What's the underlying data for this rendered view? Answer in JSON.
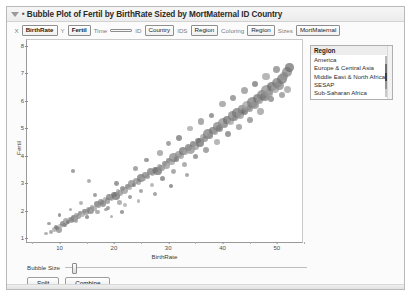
{
  "window": {
    "title": "Bubble Plot of Fertil by BirthRate Sized by MortMaternal ID Country",
    "disclosure_icon": "triangle-down-icon",
    "bullet": "▪"
  },
  "variable_bar": {
    "entries": [
      {
        "tag": "X",
        "value": "BirthRate"
      },
      {
        "tag": "Y",
        "value": "Fertil"
      },
      {
        "tag": "Time",
        "value": ""
      },
      {
        "tag": "ID",
        "value": "Country"
      },
      {
        "tag": "IDS",
        "value": "Region"
      },
      {
        "tag": "Coloring",
        "value": "Region"
      },
      {
        "tag": "Sizes",
        "value": "MortMaternal"
      }
    ]
  },
  "legend": {
    "title": "Region",
    "items": [
      {
        "label": "America",
        "color": "#b9b9b9"
      },
      {
        "label": "Europe & Central Asia",
        "color": "#6e6e6e"
      },
      {
        "label": "Middle East & North Africa",
        "color": "#3f3f3f"
      },
      {
        "label": "SESAP",
        "color": "#949494"
      },
      {
        "label": "Sub-Saharan Africa",
        "color": "#c9c9c9"
      }
    ]
  },
  "controls": {
    "bubble_size_label": "Bubble Size",
    "bubble_size_value": 3,
    "split_label": "Split",
    "combine_label": "Combine"
  },
  "chart_data": {
    "type": "scatter",
    "title": "Bubble Plot of Fertil by BirthRate Sized by MortMaternal ID Country",
    "xlabel": "BirthRate",
    "ylabel": "Fertil",
    "xlim": [
      4,
      55
    ],
    "ylim": [
      0.8,
      8.2
    ],
    "xticks": [
      10,
      20,
      30,
      40,
      50
    ],
    "yticks": [
      1,
      2,
      3,
      4,
      5,
      6,
      7,
      8
    ],
    "grid": false,
    "legend_position": "right",
    "size_variable": "MortMaternal",
    "color_variable": "Region",
    "id_variable": "Country",
    "points": [
      {
        "x": 8.5,
        "y": 1.25,
        "r": 2.0,
        "c": "#8e8e8e"
      },
      {
        "x": 9.0,
        "y": 1.32,
        "r": 2.4,
        "c": "#9b9b9b"
      },
      {
        "x": 9.4,
        "y": 1.4,
        "r": 2.0,
        "c": "#747474"
      },
      {
        "x": 9.8,
        "y": 1.3,
        "r": 3.0,
        "c": "#838383"
      },
      {
        "x": 10.2,
        "y": 1.45,
        "r": 2.2,
        "c": "#a2a2a2"
      },
      {
        "x": 10.5,
        "y": 1.55,
        "r": 2.6,
        "c": "#787878"
      },
      {
        "x": 10.8,
        "y": 1.5,
        "r": 2.0,
        "c": "#8c8c8c"
      },
      {
        "x": 11.2,
        "y": 1.62,
        "r": 3.2,
        "c": "#909090"
      },
      {
        "x": 11.6,
        "y": 1.58,
        "r": 2.0,
        "c": "#6e6e6e"
      },
      {
        "x": 11.9,
        "y": 1.7,
        "r": 2.4,
        "c": "#9a9a9a"
      },
      {
        "x": 12.2,
        "y": 1.66,
        "r": 2.8,
        "c": "#858585"
      },
      {
        "x": 12.5,
        "y": 1.78,
        "r": 2.0,
        "c": "#adadad"
      },
      {
        "x": 12.8,
        "y": 1.72,
        "r": 3.4,
        "c": "#7c7c7c"
      },
      {
        "x": 13.1,
        "y": 1.85,
        "r": 2.2,
        "c": "#949494"
      },
      {
        "x": 13.5,
        "y": 1.8,
        "r": 2.6,
        "c": "#8a8a8a"
      },
      {
        "x": 13.8,
        "y": 1.92,
        "r": 2.0,
        "c": "#707070"
      },
      {
        "x": 14.2,
        "y": 1.88,
        "r": 3.0,
        "c": "#9e9e9e"
      },
      {
        "x": 14.6,
        "y": 2.0,
        "r": 2.4,
        "c": "#7e7e7e"
      },
      {
        "x": 14.9,
        "y": 1.95,
        "r": 2.8,
        "c": "#8f8f8f"
      },
      {
        "x": 15.3,
        "y": 2.08,
        "r": 2.0,
        "c": "#a6a6a6"
      },
      {
        "x": 15.7,
        "y": 2.02,
        "r": 3.6,
        "c": "#767676"
      },
      {
        "x": 16.0,
        "y": 2.15,
        "r": 2.2,
        "c": "#8b8b8b"
      },
      {
        "x": 16.4,
        "y": 2.1,
        "r": 2.6,
        "c": "#999999"
      },
      {
        "x": 16.8,
        "y": 2.25,
        "r": 3.0,
        "c": "#6f6f6f"
      },
      {
        "x": 17.2,
        "y": 2.18,
        "r": 2.4,
        "c": "#929292"
      },
      {
        "x": 17.6,
        "y": 2.32,
        "r": 2.8,
        "c": "#828282"
      },
      {
        "x": 18.0,
        "y": 2.28,
        "r": 3.4,
        "c": "#7a7a7a"
      },
      {
        "x": 18.4,
        "y": 2.42,
        "r": 2.2,
        "c": "#a0a0a0"
      },
      {
        "x": 18.8,
        "y": 2.36,
        "r": 2.6,
        "c": "#888888"
      },
      {
        "x": 19.2,
        "y": 2.5,
        "r": 3.2,
        "c": "#757575"
      },
      {
        "x": 19.6,
        "y": 2.45,
        "r": 2.4,
        "c": "#969696"
      },
      {
        "x": 20.0,
        "y": 2.6,
        "r": 2.8,
        "c": "#808080"
      },
      {
        "x": 20.4,
        "y": 2.55,
        "r": 3.8,
        "c": "#6c6c6c"
      },
      {
        "x": 20.8,
        "y": 2.7,
        "r": 2.2,
        "c": "#a4a4a4"
      },
      {
        "x": 21.2,
        "y": 2.65,
        "r": 3.0,
        "c": "#8d8d8d"
      },
      {
        "x": 21.6,
        "y": 2.8,
        "r": 2.6,
        "c": "#7d7d7d"
      },
      {
        "x": 22.0,
        "y": 2.74,
        "r": 3.4,
        "c": "#909090"
      },
      {
        "x": 22.5,
        "y": 2.9,
        "r": 2.4,
        "c": "#727272"
      },
      {
        "x": 22.9,
        "y": 2.85,
        "r": 2.8,
        "c": "#9c9c9c"
      },
      {
        "x": 23.3,
        "y": 3.0,
        "r": 3.6,
        "c": "#848484"
      },
      {
        "x": 23.7,
        "y": 2.95,
        "r": 2.2,
        "c": "#787878"
      },
      {
        "x": 24.1,
        "y": 3.1,
        "r": 3.0,
        "c": "#8a8a8a"
      },
      {
        "x": 24.5,
        "y": 3.05,
        "r": 2.6,
        "c": "#989898"
      },
      {
        "x": 25.0,
        "y": 3.2,
        "r": 4.0,
        "c": "#6e6e6e"
      },
      {
        "x": 25.4,
        "y": 3.16,
        "r": 2.4,
        "c": "#a1a1a1"
      },
      {
        "x": 25.8,
        "y": 3.3,
        "r": 3.2,
        "c": "#7f7f7f"
      },
      {
        "x": 26.2,
        "y": 3.25,
        "r": 2.8,
        "c": "#8e8e8e"
      },
      {
        "x": 26.7,
        "y": 3.42,
        "r": 3.6,
        "c": "#767676"
      },
      {
        "x": 27.1,
        "y": 3.36,
        "r": 2.4,
        "c": "#959595"
      },
      {
        "x": 27.5,
        "y": 3.5,
        "r": 3.0,
        "c": "#838383"
      },
      {
        "x": 28.0,
        "y": 3.45,
        "r": 4.2,
        "c": "#6b6b6b"
      },
      {
        "x": 28.4,
        "y": 3.62,
        "r": 2.6,
        "c": "#9f9f9f"
      },
      {
        "x": 28.8,
        "y": 3.56,
        "r": 3.4,
        "c": "#888888"
      },
      {
        "x": 29.3,
        "y": 3.72,
        "r": 2.8,
        "c": "#7b7b7b"
      },
      {
        "x": 29.7,
        "y": 3.66,
        "r": 3.8,
        "c": "#919191"
      },
      {
        "x": 30.1,
        "y": 3.82,
        "r": 2.4,
        "c": "#737373"
      },
      {
        "x": 30.6,
        "y": 3.78,
        "r": 3.2,
        "c": "#9a9a9a"
      },
      {
        "x": 31.0,
        "y": 3.95,
        "r": 4.4,
        "c": "#818181"
      },
      {
        "x": 31.5,
        "y": 3.88,
        "r": 2.6,
        "c": "#777777"
      },
      {
        "x": 31.9,
        "y": 4.05,
        "r": 3.6,
        "c": "#8c8c8c"
      },
      {
        "x": 32.3,
        "y": 4.0,
        "r": 3.0,
        "c": "#979797"
      },
      {
        "x": 32.8,
        "y": 4.18,
        "r": 4.0,
        "c": "#6d6d6d"
      },
      {
        "x": 33.2,
        "y": 4.12,
        "r": 2.8,
        "c": "#a3a3a3"
      },
      {
        "x": 33.7,
        "y": 4.3,
        "r": 3.4,
        "c": "#7e7e7e"
      },
      {
        "x": 34.1,
        "y": 4.24,
        "r": 4.6,
        "c": "#8a8a8a"
      },
      {
        "x": 34.6,
        "y": 4.42,
        "r": 3.0,
        "c": "#757575"
      },
      {
        "x": 35.0,
        "y": 4.36,
        "r": 3.8,
        "c": "#939393"
      },
      {
        "x": 35.5,
        "y": 4.55,
        "r": 2.8,
        "c": "#828282"
      },
      {
        "x": 35.9,
        "y": 4.48,
        "r": 4.2,
        "c": "#6a6a6a"
      },
      {
        "x": 36.4,
        "y": 4.68,
        "r": 3.4,
        "c": "#9d9d9d"
      },
      {
        "x": 36.8,
        "y": 4.6,
        "r": 3.0,
        "c": "#868686"
      },
      {
        "x": 37.3,
        "y": 4.8,
        "r": 4.8,
        "c": "#797979"
      },
      {
        "x": 37.7,
        "y": 4.72,
        "r": 3.2,
        "c": "#8f8f8f"
      },
      {
        "x": 38.2,
        "y": 4.92,
        "r": 3.8,
        "c": "#717171"
      },
      {
        "x": 38.6,
        "y": 4.86,
        "r": 2.8,
        "c": "#999999"
      },
      {
        "x": 39.1,
        "y": 5.05,
        "r": 4.4,
        "c": "#808080"
      },
      {
        "x": 39.5,
        "y": 4.98,
        "r": 3.4,
        "c": "#767676"
      },
      {
        "x": 40.0,
        "y": 5.18,
        "r": 5.0,
        "c": "#8b8b8b"
      },
      {
        "x": 40.5,
        "y": 5.1,
        "r": 3.0,
        "c": "#969696"
      },
      {
        "x": 40.9,
        "y": 5.3,
        "r": 4.0,
        "c": "#6c6c6c"
      },
      {
        "x": 41.4,
        "y": 5.24,
        "r": 3.6,
        "c": "#a0a0a0"
      },
      {
        "x": 41.8,
        "y": 5.44,
        "r": 4.6,
        "c": "#7d7d7d"
      },
      {
        "x": 42.3,
        "y": 5.36,
        "r": 3.2,
        "c": "#898989"
      },
      {
        "x": 42.7,
        "y": 5.56,
        "r": 5.2,
        "c": "#747474"
      },
      {
        "x": 43.2,
        "y": 5.48,
        "r": 3.8,
        "c": "#929292"
      },
      {
        "x": 43.6,
        "y": 5.68,
        "r": 4.2,
        "c": "#818181"
      },
      {
        "x": 44.1,
        "y": 5.6,
        "r": 3.4,
        "c": "#696969"
      },
      {
        "x": 44.5,
        "y": 5.8,
        "r": 4.8,
        "c": "#9b9b9b"
      },
      {
        "x": 45.0,
        "y": 5.72,
        "r": 3.6,
        "c": "#858585"
      },
      {
        "x": 45.5,
        "y": 5.94,
        "r": 5.4,
        "c": "#787878"
      },
      {
        "x": 45.9,
        "y": 5.86,
        "r": 4.0,
        "c": "#8e8e8e"
      },
      {
        "x": 46.4,
        "y": 6.08,
        "r": 4.4,
        "c": "#707070"
      },
      {
        "x": 46.8,
        "y": 6.0,
        "r": 3.6,
        "c": "#989898"
      },
      {
        "x": 47.3,
        "y": 6.22,
        "r": 5.0,
        "c": "#7f7f7f"
      },
      {
        "x": 47.7,
        "y": 6.14,
        "r": 4.2,
        "c": "#737373"
      },
      {
        "x": 48.2,
        "y": 6.36,
        "r": 5.6,
        "c": "#8a8a8a"
      },
      {
        "x": 48.6,
        "y": 6.28,
        "r": 3.8,
        "c": "#949494"
      },
      {
        "x": 49.1,
        "y": 6.5,
        "r": 4.6,
        "c": "#6b6b6b"
      },
      {
        "x": 49.6,
        "y": 6.42,
        "r": 4.0,
        "c": "#9e9e9e"
      },
      {
        "x": 50.0,
        "y": 6.64,
        "r": 5.2,
        "c": "#7c7c7c"
      },
      {
        "x": 50.5,
        "y": 6.56,
        "r": 4.4,
        "c": "#878787"
      },
      {
        "x": 50.9,
        "y": 6.78,
        "r": 4.8,
        "c": "#757575"
      },
      {
        "x": 51.4,
        "y": 6.9,
        "r": 4.0,
        "c": "#909090"
      },
      {
        "x": 51.8,
        "y": 7.05,
        "r": 5.0,
        "c": "#808080"
      },
      {
        "x": 52.3,
        "y": 7.2,
        "r": 4.2,
        "c": "#6e6e6e"
      },
      {
        "x": 52.0,
        "y": 6.4,
        "r": 3.6,
        "c": "#9a9a9a"
      },
      {
        "x": 51.0,
        "y": 6.2,
        "r": 3.2,
        "c": "#888888"
      },
      {
        "x": 49.0,
        "y": 6.05,
        "r": 3.0,
        "c": "#7a7a7a"
      },
      {
        "x": 47.0,
        "y": 5.6,
        "r": 3.4,
        "c": "#959595"
      },
      {
        "x": 45.0,
        "y": 5.3,
        "r": 3.0,
        "c": "#828282"
      },
      {
        "x": 43.0,
        "y": 5.05,
        "r": 2.8,
        "c": "#8d8d8d"
      },
      {
        "x": 41.0,
        "y": 4.78,
        "r": 3.2,
        "c": "#767676"
      },
      {
        "x": 39.0,
        "y": 4.5,
        "r": 2.8,
        "c": "#9c9c9c"
      },
      {
        "x": 37.0,
        "y": 4.2,
        "r": 3.0,
        "c": "#848484"
      },
      {
        "x": 35.0,
        "y": 3.96,
        "r": 2.6,
        "c": "#797979"
      },
      {
        "x": 33.0,
        "y": 3.68,
        "r": 2.8,
        "c": "#919191"
      },
      {
        "x": 31.0,
        "y": 3.42,
        "r": 2.4,
        "c": "#8b8b8b"
      },
      {
        "x": 29.0,
        "y": 3.18,
        "r": 2.6,
        "c": "#727272"
      },
      {
        "x": 27.0,
        "y": 2.94,
        "r": 2.2,
        "c": "#a0a0a0"
      },
      {
        "x": 25.0,
        "y": 2.72,
        "r": 2.4,
        "c": "#868686"
      },
      {
        "x": 23.0,
        "y": 2.5,
        "r": 2.0,
        "c": "#7d7d7d"
      },
      {
        "x": 21.0,
        "y": 2.3,
        "r": 2.2,
        "c": "#969696"
      },
      {
        "x": 19.0,
        "y": 2.12,
        "r": 2.0,
        "c": "#808080"
      },
      {
        "x": 17.0,
        "y": 1.95,
        "r": 2.2,
        "c": "#8f8f8f"
      },
      {
        "x": 15.0,
        "y": 1.78,
        "r": 1.8,
        "c": "#747474"
      },
      {
        "x": 13.0,
        "y": 1.62,
        "r": 2.0,
        "c": "#9d9d9d"
      },
      {
        "x": 11.0,
        "y": 1.48,
        "r": 1.8,
        "c": "#838383"
      },
      {
        "x": 9.5,
        "y": 1.38,
        "r": 2.0,
        "c": "#787878"
      },
      {
        "x": 14.0,
        "y": 2.3,
        "r": 2.0,
        "c": "#999999"
      },
      {
        "x": 16.5,
        "y": 2.58,
        "r": 2.2,
        "c": "#7b7b7b"
      },
      {
        "x": 18.5,
        "y": 2.05,
        "r": 1.8,
        "c": "#8c8c8c"
      },
      {
        "x": 20.5,
        "y": 3.0,
        "r": 2.4,
        "c": "#717171"
      },
      {
        "x": 22.0,
        "y": 2.22,
        "r": 2.0,
        "c": "#a2a2a2"
      },
      {
        "x": 24.0,
        "y": 3.55,
        "r": 2.6,
        "c": "#858585"
      },
      {
        "x": 26.0,
        "y": 3.85,
        "r": 2.2,
        "c": "#777777"
      },
      {
        "x": 28.5,
        "y": 4.1,
        "r": 2.8,
        "c": "#939393"
      },
      {
        "x": 30.0,
        "y": 4.45,
        "r": 2.4,
        "c": "#818181"
      },
      {
        "x": 32.0,
        "y": 4.66,
        "r": 3.0,
        "c": "#6d6d6d"
      },
      {
        "x": 34.0,
        "y": 5.0,
        "r": 2.6,
        "c": "#9f9f9f"
      },
      {
        "x": 36.0,
        "y": 5.24,
        "r": 3.2,
        "c": "#898989"
      },
      {
        "x": 38.0,
        "y": 5.46,
        "r": 2.8,
        "c": "#757575"
      },
      {
        "x": 40.0,
        "y": 5.88,
        "r": 3.4,
        "c": "#929292"
      },
      {
        "x": 42.0,
        "y": 6.1,
        "r": 3.0,
        "c": "#7e7e7e"
      },
      {
        "x": 44.0,
        "y": 6.38,
        "r": 3.6,
        "c": "#8a8a8a"
      },
      {
        "x": 46.0,
        "y": 6.6,
        "r": 3.2,
        "c": "#6f6f6f"
      },
      {
        "x": 48.0,
        "y": 6.88,
        "r": 3.8,
        "c": "#9b9b9b"
      },
      {
        "x": 50.0,
        "y": 7.12,
        "r": 3.4,
        "c": "#808080"
      },
      {
        "x": 12.0,
        "y": 2.05,
        "r": 1.8,
        "c": "#8e8e8e"
      },
      {
        "x": 10.0,
        "y": 1.85,
        "r": 1.6,
        "c": "#767676"
      },
      {
        "x": 7.5,
        "y": 1.18,
        "r": 1.6,
        "c": "#9a9a9a"
      },
      {
        "x": 8.0,
        "y": 1.55,
        "r": 1.8,
        "c": "#848484"
      },
      {
        "x": 21.5,
        "y": 1.95,
        "r": 1.8,
        "c": "#7a7a7a"
      },
      {
        "x": 19.5,
        "y": 1.8,
        "r": 1.6,
        "c": "#979797"
      },
      {
        "x": 27.5,
        "y": 2.6,
        "r": 2.0,
        "c": "#828282"
      },
      {
        "x": 30.5,
        "y": 2.9,
        "r": 2.2,
        "c": "#6c6c6c"
      },
      {
        "x": 24.5,
        "y": 2.35,
        "r": 1.8,
        "c": "#a1a1a1"
      },
      {
        "x": 33.5,
        "y": 3.3,
        "r": 2.0,
        "c": "#888888"
      },
      {
        "x": 12.5,
        "y": 3.45,
        "r": 1.8,
        "c": "#7f7f7f"
      },
      {
        "x": 15.5,
        "y": 3.1,
        "r": 2.0,
        "c": "#909090"
      }
    ]
  }
}
